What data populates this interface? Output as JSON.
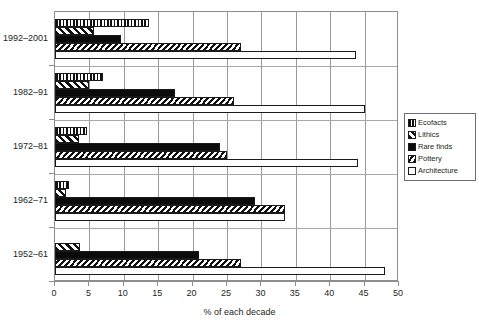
{
  "chart_data": {
    "type": "bar",
    "orientation": "horizontal",
    "title": "",
    "subtitle": "",
    "xlabel": "% of each decade",
    "ylabel": "",
    "xlim": [
      0,
      50
    ],
    "ylim": null,
    "grid": true,
    "grid_axis": "x",
    "legend_position": "right",
    "xticks": [
      0,
      5,
      10,
      15,
      20,
      25,
      30,
      35,
      40,
      45,
      50
    ],
    "xticklabels": [
      "0",
      "5",
      "10",
      "15",
      "20",
      "25",
      "30",
      "35",
      "40",
      "45",
      "50"
    ],
    "categories": [
      "1992–2001",
      "1982–91",
      "1972–81",
      "1962–71",
      "1952–61"
    ],
    "series": [
      {
        "name": "Ecofacts",
        "pattern": "vertical-stripes",
        "values": [
          13.7,
          7.0,
          4.6,
          2.0,
          0.0
        ]
      },
      {
        "name": "Lithics",
        "pattern": "diagonal-hatch",
        "values": [
          5.7,
          5.0,
          3.5,
          1.6,
          3.6
        ]
      },
      {
        "name": "Rare finds",
        "pattern": "solid-black",
        "values": [
          9.6,
          17.5,
          24.0,
          29.0,
          21.0
        ]
      },
      {
        "name": "Pottery",
        "pattern": "dense-diagonal-hatch",
        "values": [
          27.0,
          26.0,
          25.0,
          33.5,
          27.0
        ]
      },
      {
        "name": "Architecture",
        "pattern": "white-open",
        "values": [
          43.7,
          45.0,
          44.0,
          33.5,
          48.0
        ]
      }
    ]
  },
  "legend": {
    "items": [
      {
        "label": "Ecofacts"
      },
      {
        "label": "Lithics"
      },
      {
        "label": "Rare finds"
      },
      {
        "label": "Pottery"
      },
      {
        "label": "Architecture"
      }
    ]
  },
  "colors": {
    "ink": "#231f20",
    "bar_outline": "#1a1a1a",
    "solid_fill": "#0b0b0b",
    "grid": "#9a9a9a",
    "frame": "#8d8d8d",
    "background": "#ffffff"
  }
}
